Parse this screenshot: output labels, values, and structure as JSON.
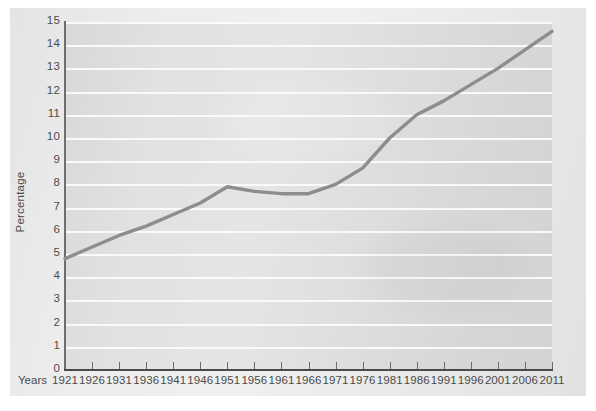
{
  "figure": {
    "y_axis_title": "Percentage",
    "x_axis_caption": "Years"
  },
  "colors": {
    "line": "#8d8d8d",
    "plot_background": "#dedede",
    "gridline": "#fafafa",
    "page_background": "#e9e9e9",
    "axis": "#4a4a4a",
    "text": "#4b4b4b"
  },
  "chart_data": {
    "type": "line",
    "title": "",
    "xlabel": "Years",
    "ylabel": "Percentage",
    "xlim": [
      1921,
      2011
    ],
    "ylim": [
      0,
      15
    ],
    "grid": true,
    "legend": "none",
    "y_ticks": [
      0,
      1,
      2,
      3,
      4,
      5,
      6,
      7,
      8,
      9,
      10,
      11,
      12,
      13,
      14,
      15
    ],
    "x_ticks": [
      1921,
      1926,
      1931,
      1936,
      1941,
      1946,
      1951,
      1956,
      1961,
      1966,
      1971,
      1976,
      1981,
      1986,
      1991,
      1996,
      2001,
      2006,
      2011
    ],
    "categories": [
      1921,
      1926,
      1931,
      1936,
      1941,
      1946,
      1951,
      1956,
      1961,
      1966,
      1971,
      1976,
      1981,
      1986,
      1991,
      1996,
      2001,
      2006,
      2011
    ],
    "values": [
      4.8,
      5.3,
      5.8,
      6.2,
      6.7,
      7.2,
      7.9,
      7.7,
      7.6,
      7.6,
      8.0,
      8.7,
      10.0,
      11.0,
      11.6,
      12.3,
      13.0,
      13.8,
      14.6
    ],
    "series": [
      {
        "name": "Percentage",
        "values": [
          4.8,
          5.3,
          5.8,
          6.2,
          6.7,
          7.2,
          7.9,
          7.7,
          7.6,
          7.6,
          8.0,
          8.7,
          10.0,
          11.0,
          11.6,
          12.3,
          13.0,
          13.8,
          14.6
        ]
      }
    ]
  }
}
